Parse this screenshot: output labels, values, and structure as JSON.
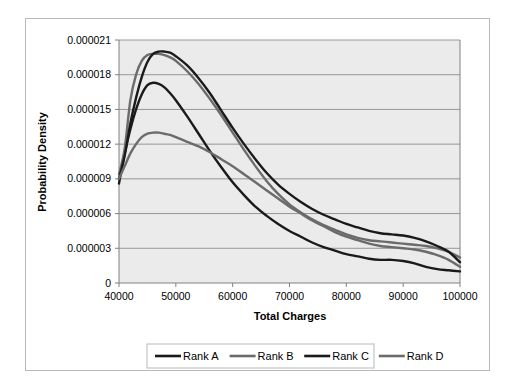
{
  "figure": {
    "background_color": "#ffffff",
    "frame_border_color": "#b9b9b9",
    "plot_background_color": "#ebebeb",
    "gridline_color": "#808080"
  },
  "chart_data": {
    "type": "line",
    "title": "",
    "xlabel": "Total Charges",
    "ylabel": "Probability Density",
    "xlim": [
      40000,
      100000
    ],
    "ylim": [
      0,
      2.1e-05
    ],
    "xticks": [
      40000,
      50000,
      60000,
      70000,
      80000,
      90000,
      100000
    ],
    "xtick_labels": [
      "40000",
      "50000",
      "60000",
      "70000",
      "80000",
      "90000",
      "100000"
    ],
    "yticks": [
      0,
      3e-06,
      6e-06,
      9e-06,
      1.2e-05,
      1.5e-05,
      1.8e-05,
      2.1e-05
    ],
    "ytick_labels": [
      "0",
      "0.000003",
      "0.000006",
      "0.000009",
      "0.000012",
      "0.000015",
      "0.000018",
      "0.000021"
    ],
    "grid": "horizontal",
    "legend_position": "bottom",
    "x": [
      40000,
      41000,
      42000,
      43000,
      44000,
      45000,
      46000,
      47000,
      48000,
      49000,
      50000,
      52000,
      54000,
      56000,
      58000,
      60000,
      62000,
      64000,
      66000,
      68000,
      70000,
      72000,
      74000,
      76000,
      78000,
      80000,
      82000,
      84000,
      86000,
      88000,
      90000,
      92000,
      94000,
      96000,
      98000,
      100000
    ],
    "series": [
      {
        "name": "Rank A",
        "color": "#1a1a1a",
        "values": [
          8.6e-06,
          1.12e-05,
          1.33e-05,
          1.5e-05,
          1.63e-05,
          1.71e-05,
          1.73e-05,
          1.72e-05,
          1.69e-05,
          1.64e-05,
          1.58e-05,
          1.44e-05,
          1.29e-05,
          1.14e-05,
          1e-05,
          8.7e-06,
          7.6e-06,
          6.6e-06,
          5.8e-06,
          5.1e-06,
          4.5e-06,
          4e-06,
          3.5e-06,
          3.1e-06,
          2.8e-06,
          2.5e-06,
          2.3e-06,
          2.1e-06,
          2e-06,
          2e-06,
          1.9e-06,
          1.7e-06,
          1.4e-06,
          1.2e-06,
          1.1e-06,
          1e-06
        ]
      },
      {
        "name": "Rank B",
        "color": "#6b6b6b",
        "values": [
          9.4e-06,
          1.16e-05,
          1.58e-05,
          1.8e-05,
          1.92e-05,
          1.97e-05,
          1.98e-05,
          1.98e-05,
          1.97e-05,
          1.95e-05,
          1.92e-05,
          1.83e-05,
          1.72e-05,
          1.59e-05,
          1.45e-05,
          1.3e-05,
          1.15e-05,
          1.01e-05,
          8.8e-06,
          7.7e-06,
          6.8e-06,
          6.1e-06,
          5.5e-06,
          5e-06,
          4.6e-06,
          4.2e-06,
          3.9e-06,
          3.7e-06,
          3.6e-06,
          3.5e-06,
          3.4e-06,
          3.3e-06,
          3.2e-06,
          3e-06,
          2.7e-06,
          2.2e-06
        ]
      },
      {
        "name": "Rank C",
        "color": "#1a1a1a",
        "values": [
          9e-06,
          1.1e-05,
          1.38e-05,
          1.6e-05,
          1.78e-05,
          1.91e-05,
          1.98e-05,
          2e-05,
          2e-05,
          1.99e-05,
          1.96e-05,
          1.88e-05,
          1.77e-05,
          1.64e-05,
          1.49e-05,
          1.34e-05,
          1.2e-05,
          1.07e-05,
          9.5e-06,
          8.5e-06,
          7.7e-06,
          7e-06,
          6.4e-06,
          5.9e-06,
          5.5e-06,
          5.1e-06,
          4.8e-06,
          4.5e-06,
          4.3e-06,
          4.2e-06,
          4.1e-06,
          3.9e-06,
          3.6e-06,
          3.2e-06,
          2.7e-06,
          1.8e-06
        ]
      },
      {
        "name": "Rank D",
        "color": "#6b6b6b",
        "values": [
          9e-06,
          1.01e-05,
          1.12e-05,
          1.2e-05,
          1.26e-05,
          1.29e-05,
          1.3e-05,
          1.3e-05,
          1.29e-05,
          1.28e-05,
          1.26e-05,
          1.22e-05,
          1.18e-05,
          1.13e-05,
          1.07e-05,
          1.01e-05,
          9.4e-06,
          8.7e-06,
          8e-06,
          7.3e-06,
          6.6e-06,
          6e-06,
          5.4e-06,
          4.9e-06,
          4.4e-06,
          4e-06,
          3.7e-06,
          3.4e-06,
          3.2e-06,
          3.1e-06,
          3e-06,
          2.9e-06,
          2.7e-06,
          2.4e-06,
          2e-06,
          1.4e-06
        ]
      }
    ]
  },
  "legend": {
    "items": [
      {
        "label": "Rank A",
        "color": "#1a1a1a"
      },
      {
        "label": "Rank B",
        "color": "#6b6b6b"
      },
      {
        "label": "Rank C",
        "color": "#1a1a1a"
      },
      {
        "label": "Rank D",
        "color": "#6b6b6b"
      }
    ]
  }
}
